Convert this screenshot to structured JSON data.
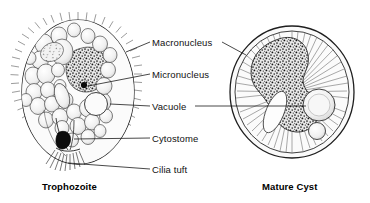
{
  "figure": {
    "background_color": "#ffffff",
    "ink_color": "#111111",
    "leader_line_color": "#1a1a1a"
  },
  "labels": [
    {
      "id": "macronucleus",
      "text": "Macronucleus",
      "x": 152,
      "y": 37,
      "leaders": [
        "left",
        "right"
      ]
    },
    {
      "id": "micronucleus",
      "text": "Micronucleus",
      "x": 152,
      "y": 69,
      "leaders": [
        "left"
      ]
    },
    {
      "id": "vacuole",
      "text": "Vacuole",
      "x": 152,
      "y": 101,
      "leaders": [
        "left",
        "right"
      ]
    },
    {
      "id": "cytostome",
      "text": "Cytostome",
      "x": 152,
      "y": 133,
      "leaders": [
        "left"
      ]
    },
    {
      "id": "cilia-tuft",
      "text": "Cilia tuft",
      "x": 152,
      "y": 164,
      "leaders": [
        "left"
      ]
    }
  ],
  "captions": [
    {
      "id": "trophozoite",
      "text": "Trophozoite",
      "x": 42,
      "y": 181
    },
    {
      "id": "mature-cyst",
      "text": "Mature Cyst",
      "x": 262,
      "y": 181
    }
  ],
  "specimens": [
    {
      "id": "trophozoite",
      "name": "Trophozoite",
      "shape": "ovoid ciliated cell",
      "features": [
        "cilia",
        "macronucleus",
        "micronucleus",
        "food vacuoles",
        "cytostome",
        "cilia tuft"
      ]
    },
    {
      "id": "mature-cyst",
      "name": "Mature Cyst",
      "shape": "round double-walled cyst",
      "features": [
        "cyst wall",
        "radial striations",
        "macronucleus",
        "vacuoles"
      ]
    }
  ]
}
